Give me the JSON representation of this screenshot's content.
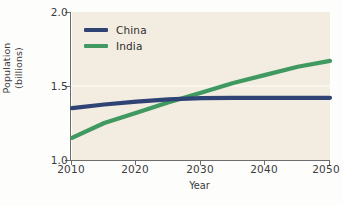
{
  "chart_data": {
    "type": "line",
    "title": "",
    "xlabel": "Year",
    "ylabel": "Population (billions)",
    "ylabel_line1": "Population",
    "ylabel_line2": "(billions)",
    "xlim": [
      2010,
      2050
    ],
    "ylim": [
      1.0,
      2.0
    ],
    "xticks": [
      "2010",
      "2020",
      "2030",
      "2040",
      "2050"
    ],
    "yticks": [
      "1.0",
      "1.5",
      "2.0"
    ],
    "grid": "horizontal-faint",
    "legend_position": "upper-left-inside",
    "x": [
      2010,
      2015,
      2020,
      2025,
      2030,
      2035,
      2040,
      2045,
      2050
    ],
    "series": [
      {
        "name": "China",
        "color": "#2f4474",
        "values": [
          1.35,
          1.375,
          1.395,
          1.41,
          1.418,
          1.42,
          1.42,
          1.42,
          1.42
        ]
      },
      {
        "name": "India",
        "color": "#3f9960",
        "values": [
          1.15,
          1.25,
          1.32,
          1.39,
          1.455,
          1.52,
          1.575,
          1.63,
          1.67
        ]
      }
    ],
    "colors": {
      "china": "#2f4474",
      "india": "#3f9960",
      "plot_background": "#f2ece1",
      "figure_background": "#fdfdfb",
      "axis": "#6d6d6d",
      "text": "#3b3b3b",
      "gridline": "#fbf7ef"
    }
  },
  "legend": {
    "items": [
      {
        "label": "China",
        "color": "#2f4474"
      },
      {
        "label": "India",
        "color": "#3f9960"
      }
    ]
  },
  "axes": {
    "y": {
      "title_line1": "Population",
      "title_line2": "(billions)",
      "ticks": [
        {
          "label": "2.0",
          "value": 2.0
        },
        {
          "label": "1.5",
          "value": 1.5
        },
        {
          "label": "1.0",
          "value": 1.0
        }
      ]
    },
    "x": {
      "title": "Year",
      "ticks": [
        {
          "label": "2010",
          "value": 2010
        },
        {
          "label": "2020",
          "value": 2020
        },
        {
          "label": "2030",
          "value": 2030
        },
        {
          "label": "2040",
          "value": 2040
        },
        {
          "label": "2050",
          "value": 2050
        }
      ]
    }
  }
}
